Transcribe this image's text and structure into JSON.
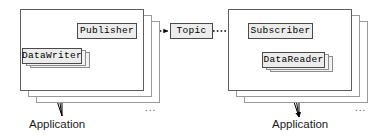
{
  "diagram": {
    "colors": {
      "node_fill": "#ececec",
      "node_stroke": "#4a4a4a",
      "container_stroke": "#5d5d5d",
      "ghost_stroke": "#9a9a9a",
      "arrow_solid": "#000000",
      "arrow_dotted": "#000000",
      "text": "#000000"
    },
    "left_domain": {
      "container_label": "Application",
      "container_stack_count": 3,
      "ellipsis": "...",
      "nodes": [
        {
          "id": "publisher",
          "label": "Publisher",
          "stack_count": 1
        },
        {
          "id": "datawriter",
          "label": "DataWriter",
          "stack_count": 3
        }
      ],
      "flows": [
        {
          "from": "DataWriter",
          "to": "Publisher",
          "style": "solid",
          "multiplicity": 3
        },
        {
          "from": "Application",
          "to": "DataWriter",
          "style": "solid",
          "multiplicity": 3,
          "direction": "up"
        }
      ]
    },
    "center": {
      "nodes": [
        {
          "id": "topic",
          "label": "Topic",
          "stack_count": 1
        }
      ],
      "flows": [
        {
          "from": "Publisher",
          "to": "Topic",
          "style": "dotted",
          "multiplicity": 1
        },
        {
          "from": "Topic",
          "to": "Subscriber",
          "style": "dotted",
          "multiplicity": 1
        }
      ]
    },
    "right_domain": {
      "container_label": "Application",
      "container_stack_count": 3,
      "ellipsis": "...",
      "nodes": [
        {
          "id": "subscriber",
          "label": "Subscriber",
          "stack_count": 1
        },
        {
          "id": "datareader",
          "label": "DataReader",
          "stack_count": 3
        }
      ],
      "flows": [
        {
          "from": "Subscriber",
          "to": "DataReader",
          "style": "solid",
          "multiplicity": 1
        },
        {
          "from": "DataReader",
          "to": "Application",
          "style": "solid",
          "multiplicity": 3,
          "direction": "down"
        }
      ]
    }
  }
}
